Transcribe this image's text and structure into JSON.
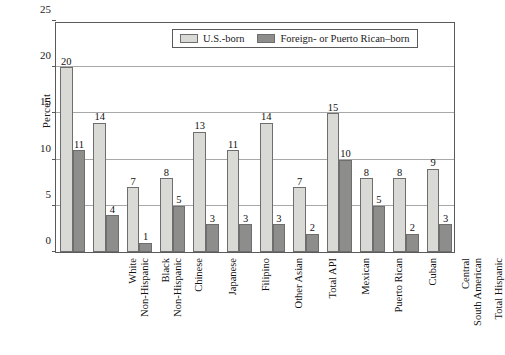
{
  "chart_data": {
    "type": "bar",
    "title": "",
    "xlabel": "",
    "ylabel": "Percent",
    "ylim": [
      0,
      25
    ],
    "yticks": [
      0,
      5,
      10,
      15,
      20,
      25
    ],
    "grid": true,
    "legend_position": "top-center",
    "categories": [
      "White Non-Hispanic",
      "Black Non-Hispanic",
      "Chinese",
      "Japanese",
      "Filipino",
      "Other Asian",
      "Total API",
      "Mexican",
      "Puerto Rican",
      "Cuban",
      "Central South American",
      "Total Hispanic"
    ],
    "category_lines": [
      [
        "White",
        "Non-Hispanic"
      ],
      [
        "Black",
        "Non-Hispanic"
      ],
      [
        "Chinese",
        ""
      ],
      [
        "Japanese",
        ""
      ],
      [
        "Filipino",
        ""
      ],
      [
        "Other Asian",
        ""
      ],
      [
        "Total API",
        ""
      ],
      [
        "Mexican",
        ""
      ],
      [
        "Puerto Rican",
        ""
      ],
      [
        "Cuban",
        ""
      ],
      [
        "Central",
        "South American"
      ],
      [
        "Total Hispanic",
        ""
      ]
    ],
    "series": [
      {
        "name": "U.S.-born",
        "color": "#d9d9d5",
        "values": [
          20,
          14,
          7,
          8,
          13,
          11,
          14,
          7,
          15,
          8,
          8,
          9
        ]
      },
      {
        "name": "Foreign- or Puerto Rican–born",
        "color": "#8d8d8b",
        "values": [
          11,
          4,
          1,
          5,
          3,
          3,
          3,
          2,
          10,
          5,
          2,
          3
        ]
      }
    ]
  },
  "legend": {
    "items": [
      {
        "label": "U.S.-born",
        "swatch": "light"
      },
      {
        "label": "Foreign- or Puerto Rican–born",
        "swatch": "dark"
      }
    ]
  },
  "axes": {
    "y_title": "Percent",
    "y_tick_labels": [
      "0",
      "5",
      "10",
      "15",
      "20",
      "25"
    ]
  },
  "colors": {
    "light_bar": "#d9d9d5",
    "dark_bar": "#8d8d8b",
    "bar_border": "#6e6e6e",
    "axis": "#5a5a5a",
    "gridline": "#a8a8a8",
    "background": "#ffffff",
    "text": "#111111"
  }
}
